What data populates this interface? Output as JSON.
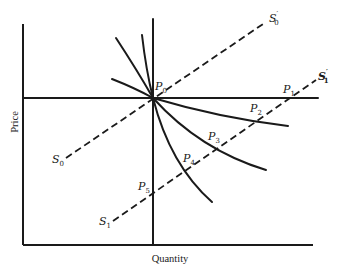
{
  "diagram": {
    "axes": {
      "x_label": "Quantity",
      "y_label": "Price"
    },
    "points": {
      "p0": {
        "name": "P",
        "sub": "0"
      },
      "p1": {
        "name": "P",
        "sub": "1"
      },
      "p2": {
        "name": "P",
        "sub": "2"
      },
      "p3": {
        "name": "P",
        "sub": "3"
      },
      "p4": {
        "name": "P",
        "sub": "4"
      },
      "p5": {
        "name": "P",
        "sub": "5"
      }
    },
    "supply_curves": {
      "s0": {
        "name": "S",
        "sub": "0"
      },
      "s0_prime": {
        "name": "S",
        "sub": "0",
        "prime": "′"
      },
      "s1": {
        "name": "S",
        "sub": "1"
      },
      "s1_prime": {
        "name": "S",
        "sub": "1",
        "prime": "′"
      }
    },
    "colors": {
      "ink": "#1a1a1a",
      "background": "#ffffff"
    }
  }
}
